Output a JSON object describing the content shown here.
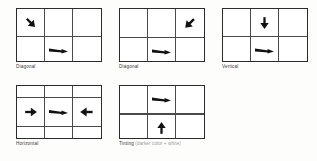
{
  "figure": {
    "type": "diagram-grid-set",
    "background_color": "#fdfdfc",
    "grid_line_color": "#4a4a4a",
    "arrow_color": "#111111",
    "caption_color": "#3a3a3a",
    "subtitle_color": "#9a9a9a"
  },
  "panels": [
    {
      "id": "panel-diagonal-1",
      "caption": "Diagonal",
      "subtitle": "",
      "grid": {
        "rows": 3,
        "cols": 3
      },
      "arrows": [
        {
          "cell": "r0c0",
          "direction": "down-right",
          "icon": "arrow-down-right-icon",
          "style": "solid"
        },
        {
          "cell": "r1c1",
          "direction": "right",
          "icon": "arrow-right-tapered-icon",
          "style": "tapered"
        },
        {
          "cell": "r2c2",
          "direction": "up-left",
          "icon": "arrow-up-left-icon",
          "style": "solid"
        }
      ]
    },
    {
      "id": "panel-diagonal-2",
      "caption": "Diagonal",
      "subtitle": "",
      "grid": {
        "rows": 3,
        "cols": 3
      },
      "arrows": [
        {
          "cell": "r0c2",
          "direction": "down-left",
          "icon": "arrow-down-left-icon",
          "style": "solid"
        },
        {
          "cell": "r1c1",
          "direction": "right",
          "icon": "arrow-right-tapered-icon",
          "style": "tapered"
        },
        {
          "cell": "r2c0",
          "direction": "up-right",
          "icon": "arrow-up-right-icon",
          "style": "solid"
        }
      ]
    },
    {
      "id": "panel-vertical",
      "caption": "Vertical",
      "subtitle": "",
      "grid": {
        "rows": 3,
        "cols": 3
      },
      "clipped_right": true,
      "arrows": [
        {
          "cell": "r0c1",
          "direction": "down",
          "icon": "arrow-down-icon",
          "style": "solid"
        },
        {
          "cell": "r1c1",
          "direction": "right",
          "icon": "arrow-right-tapered-icon",
          "style": "tapered"
        },
        {
          "cell": "r2c1",
          "direction": "up",
          "icon": "arrow-up-icon",
          "style": "solid"
        }
      ]
    },
    {
      "id": "panel-horizontal",
      "caption": "Horizontal",
      "subtitle": "",
      "grid": {
        "rows": 3,
        "cols": 3
      },
      "arrows": [
        {
          "cell": "r1c0",
          "direction": "right",
          "icon": "arrow-right-icon",
          "style": "solid"
        },
        {
          "cell": "r1c1",
          "direction": "right",
          "icon": "arrow-right-tapered-icon",
          "style": "tapered"
        },
        {
          "cell": "r1c2",
          "direction": "left",
          "icon": "arrow-left-icon",
          "style": "solid"
        }
      ]
    },
    {
      "id": "panel-tinting",
      "caption": "Tinting",
      "subtitle": "(darker color + white)",
      "grid": {
        "rows": 3,
        "cols": 3
      },
      "arrows": [
        {
          "cell": "r0c1",
          "direction": "right",
          "icon": "arrow-right-tapered-icon",
          "style": "tapered"
        },
        {
          "cell": "r2c1",
          "direction": "up",
          "icon": "arrow-up-icon",
          "style": "solid"
        }
      ]
    }
  ]
}
